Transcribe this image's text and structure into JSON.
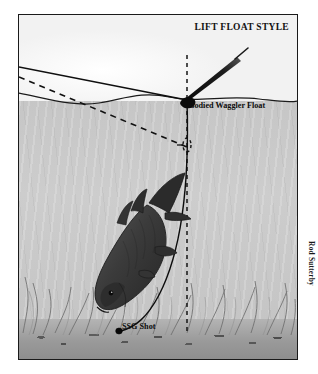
{
  "illustration": {
    "title": "LIFT FLOAT STYLE",
    "credit": "Rod Sutterby",
    "labels": {
      "float": "Bodied Waggler Float",
      "shot": "SSG Shot"
    },
    "colors": {
      "sky": "#f6f6f6",
      "water": "#c8c8c8",
      "lakebed": "#979797",
      "line": "#111111",
      "fish": "#3a3a3a",
      "frame": "#1a1a1a"
    },
    "scene": {
      "medium": "pen-and-ink / wash angling diagram",
      "subject": "bream taking bait on a lift-float rig",
      "elements": [
        "sky above wavy water surface",
        "grey water column",
        "weeded lakebed",
        "bodied waggler float cocked at the surface",
        "mainline from rod to float",
        "dashed alternative line path",
        "dark bream angled head-down",
        "SSG shot resting on the bottom"
      ]
    }
  }
}
